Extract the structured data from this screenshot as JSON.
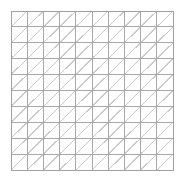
{
  "figure": {
    "title": "",
    "caption": "",
    "background_color": "#ffffff"
  },
  "chart_data": {
    "type": "diagram",
    "title": "",
    "subtitle": "",
    "xlabel": "",
    "ylabel": "",
    "shape": "square-grid-with-diagonals",
    "rows": 10,
    "columns": 10,
    "total_cells": 100,
    "total_triangles": 200,
    "diagonal_direction": "bottom-left-to-top-right",
    "grid_left": 11,
    "grid_top": 11,
    "grid_right": 173,
    "grid_bottom": 170,
    "grid_width": 162,
    "grid_height": 159,
    "cell_width": 16.2,
    "cell_height": 15.9,
    "grid": true,
    "legend": false,
    "axes_visible": false,
    "tick_labels_x": [],
    "tick_labels_y": [],
    "xlim": [
      0,
      10
    ],
    "ylim": [
      0,
      10
    ],
    "colors": {
      "background": "#ffffff",
      "grid_line": "#a8a8a8",
      "diagonal_line": "#c8c8c8",
      "border": "#a0a0a0"
    },
    "line_widths": {
      "grid_line": 1,
      "diagonal_line": 1,
      "border": 1
    }
  }
}
